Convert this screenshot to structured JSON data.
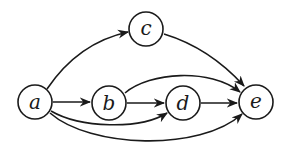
{
  "diagram": {
    "type": "directed-graph",
    "colors": {
      "stroke": "#1a1a1a",
      "background": "#ffffff"
    },
    "nodes": [
      {
        "id": "a",
        "label": "a",
        "cx": 35,
        "cy": 102
      },
      {
        "id": "b",
        "label": "b",
        "cx": 109,
        "cy": 103
      },
      {
        "id": "c",
        "label": "c",
        "cx": 146,
        "cy": 29
      },
      {
        "id": "d",
        "label": "d",
        "cx": 183,
        "cy": 103
      },
      {
        "id": "e",
        "label": "e",
        "cx": 256,
        "cy": 102
      }
    ],
    "edges": [
      {
        "from": "a",
        "to": "c"
      },
      {
        "from": "c",
        "to": "e"
      },
      {
        "from": "a",
        "to": "b"
      },
      {
        "from": "b",
        "to": "d"
      },
      {
        "from": "d",
        "to": "e"
      },
      {
        "from": "b",
        "to": "e"
      },
      {
        "from": "a",
        "to": "d"
      },
      {
        "from": "a",
        "to": "e"
      }
    ]
  }
}
